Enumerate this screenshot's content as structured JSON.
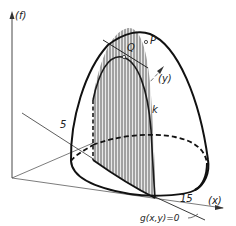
{
  "figure": {
    "type": "3d-surface-diagram",
    "axes": {
      "f": "(f)",
      "y": "(y)",
      "x": "(x)"
    },
    "points": {
      "P": "P",
      "Q": "Q"
    },
    "curve_label": "k",
    "tick_labels": {
      "y_tick": "5",
      "x_tick": "15"
    },
    "constraint_label": "g(x,y)=0",
    "colors": {
      "ink": "#1a1a1a",
      "hatch": "#555555",
      "background": "#ffffff"
    }
  }
}
